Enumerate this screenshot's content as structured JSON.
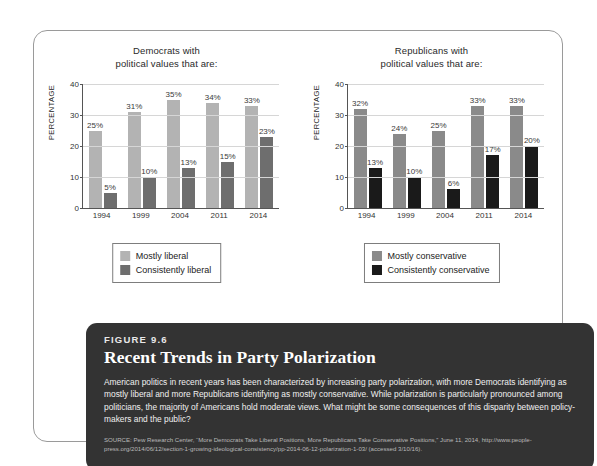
{
  "figure": {
    "number_label": "FIGURE 9.6",
    "title": "Recent Trends in Party Polarization",
    "body": "American politics in recent years has been characterized by increasing party polarization, with more Democrats identifying as mostly liberal and more Republicans identifying as mostly conservative. While polarization is particularly pronounced among politicians, the majority of Americans hold moderate views. What might be some consequences of this disparity between policy-makers and the public?",
    "source": "SOURCE: Pew Research Center, “More Democrats Take Liberal Positions, More Republicans Take Conservative Positions,” June 11, 2014, http://www.people-press.org/2014/06/12/section-1-growing-ideological-consistency/pp-2014-06-12-polarization-1-03/ (accessed 3/10/16).",
    "panel_color": "#333333"
  },
  "chart_data": [
    {
      "type": "bar",
      "title": "Democrats with political values that are:",
      "title_line1": "Democrats with",
      "title_line2": "political values that are:",
      "xlabel": "",
      "ylabel": "PERCENTAGE",
      "ylim": [
        0,
        40
      ],
      "yticks": [
        0,
        10,
        20,
        30,
        40
      ],
      "ytick_labels": [
        "0",
        "10",
        "20",
        "30",
        "40"
      ],
      "grid": true,
      "legend_position": "bottom-center",
      "categories": [
        "1994",
        "1999",
        "2004",
        "2011",
        "2014"
      ],
      "series": [
        {
          "name": "Mostly liberal",
          "color": "#b3b3b3",
          "values": [
            25,
            31,
            35,
            34,
            33
          ],
          "labels": [
            "25%",
            "31%",
            "35%",
            "34%",
            "33%"
          ]
        },
        {
          "name": "Consistently liberal",
          "color": "#6e6e6e",
          "values": [
            5,
            10,
            13,
            15,
            23
          ],
          "labels": [
            "5%",
            "10%",
            "13%",
            "15%",
            "23%"
          ]
        }
      ]
    },
    {
      "type": "bar",
      "title": "Republicans with political values that are:",
      "title_line1": "Republicans with",
      "title_line2": "political values that are:",
      "xlabel": "",
      "ylabel": "PERCENTAGE",
      "ylim": [
        0,
        40
      ],
      "yticks": [
        0,
        10,
        20,
        30,
        40
      ],
      "ytick_labels": [
        "0",
        "10",
        "20",
        "30",
        "40"
      ],
      "grid": true,
      "legend_position": "bottom-center",
      "categories": [
        "1994",
        "1999",
        "2004",
        "2011",
        "2014"
      ],
      "series": [
        {
          "name": "Mostly conservative",
          "color": "#8a8a8a",
          "values": [
            32,
            24,
            25,
            33,
            33
          ],
          "labels": [
            "32%",
            "24%",
            "25%",
            "33%",
            "33%"
          ]
        },
        {
          "name": "Consistently conservative",
          "color": "#1a1a1a",
          "values": [
            13,
            10,
            6,
            17,
            20
          ],
          "labels": [
            "13%",
            "10%",
            "6%",
            "17%",
            "20%"
          ]
        }
      ]
    }
  ]
}
